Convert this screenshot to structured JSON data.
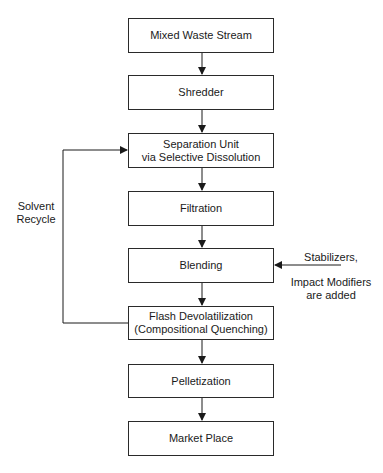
{
  "diagram": {
    "type": "flowchart",
    "nodes": [
      {
        "id": "mixed-waste-stream",
        "lines": [
          "Mixed Waste Stream"
        ]
      },
      {
        "id": "shredder",
        "lines": [
          "Shredder"
        ]
      },
      {
        "id": "separation-unit",
        "lines": [
          "Separation Unit",
          "via Selective Dissolution"
        ]
      },
      {
        "id": "filtration",
        "lines": [
          "Filtration"
        ]
      },
      {
        "id": "blending",
        "lines": [
          "Blending"
        ]
      },
      {
        "id": "flash-devolatilization",
        "lines": [
          "Flash Devolatilization",
          "(Compositional Quenching)"
        ]
      },
      {
        "id": "pelletization",
        "lines": [
          "Pelletization"
        ]
      },
      {
        "id": "market-place",
        "lines": [
          "Market Place"
        ]
      }
    ],
    "edges": [
      {
        "from": "mixed-waste-stream",
        "to": "shredder"
      },
      {
        "from": "shredder",
        "to": "separation-unit"
      },
      {
        "from": "separation-unit",
        "to": "filtration"
      },
      {
        "from": "filtration",
        "to": "blending"
      },
      {
        "from": "blending",
        "to": "flash-devolatilization"
      },
      {
        "from": "flash-devolatilization",
        "to": "pelletization"
      },
      {
        "from": "pelletization",
        "to": "market-place"
      },
      {
        "from": "flash-devolatilization",
        "to": "separation-unit",
        "label": "Solvent Recycle"
      },
      {
        "from": "external-input",
        "to": "blending",
        "label": "Stabilizers, Impact Modifiers are added"
      }
    ],
    "recycle_label": [
      "Solvent",
      "Recycle"
    ],
    "side_input_label": [
      "Stabilizers,",
      "Impact Modifiers",
      "are added"
    ]
  }
}
